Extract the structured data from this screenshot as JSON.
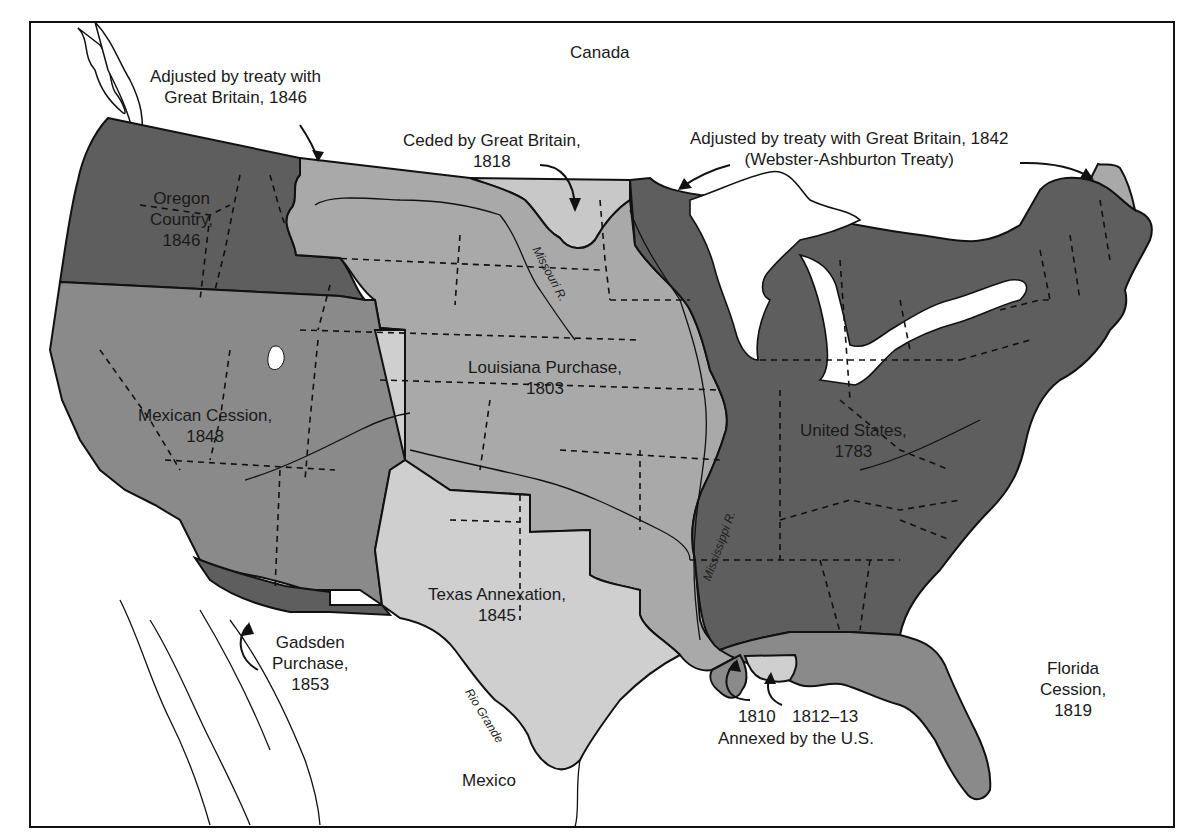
{
  "map": {
    "title": "Territorial Expansion of the United States",
    "colors": {
      "us_1783": "#5e5e5e",
      "oregon_1846": "#5e5e5e",
      "mexican_cession_1848": "#8a8a8a",
      "gadsden_1853": "#5e5e5e",
      "louisiana_1803": "#a9a9a9",
      "ceded_gb_1818": "#c8c8c8",
      "texas_1845": "#cfcfcf",
      "florida_1819": "#8a8a8a",
      "annexed_1810": "#8a8a8a",
      "annexed_1812": "#cfcfcf",
      "maine_1842": "#a9a9a9",
      "water": "#ffffff",
      "border": "#111111"
    },
    "countries": {
      "canada": "Canada",
      "mexico": "Mexico"
    },
    "regions": [
      {
        "id": "oregon",
        "line1": "Oregon",
        "line2": "Country,",
        "line3": "1846"
      },
      {
        "id": "louisiana",
        "line1": "Louisiana Purchase,",
        "line2": "1803"
      },
      {
        "id": "mexican",
        "line1": "Mexican Cession,",
        "line2": "1848"
      },
      {
        "id": "us",
        "line1": "United States,",
        "line2": "1783"
      },
      {
        "id": "texas",
        "line1": "Texas Annexation,",
        "line2": "1845"
      },
      {
        "id": "gadsden",
        "line1": "Gadsden",
        "line2": "Purchase,",
        "line3": "1853"
      },
      {
        "id": "florida",
        "line1": "Florida",
        "line2": "Cession,",
        "line3": "1819"
      }
    ],
    "annotations": {
      "treaty_1846": {
        "line1": "Adjusted by treaty with",
        "line2": "Great Britain, 1846"
      },
      "ceded_1818": {
        "line1": "Ceded by Great Britain,",
        "line2": "1818"
      },
      "treaty_1842": {
        "line1": "Adjusted by treaty with Great Britain, 1842",
        "line2": "(Webster-Ashburton Treaty)"
      },
      "annexed": {
        "year1": "1810",
        "year2": "1812–13",
        "caption": "Annexed by the U.S."
      }
    },
    "rivers": {
      "missouri": "Missouri R.",
      "mississippi": "Mississippi R.",
      "rio_grande": "Rio Grande"
    }
  }
}
